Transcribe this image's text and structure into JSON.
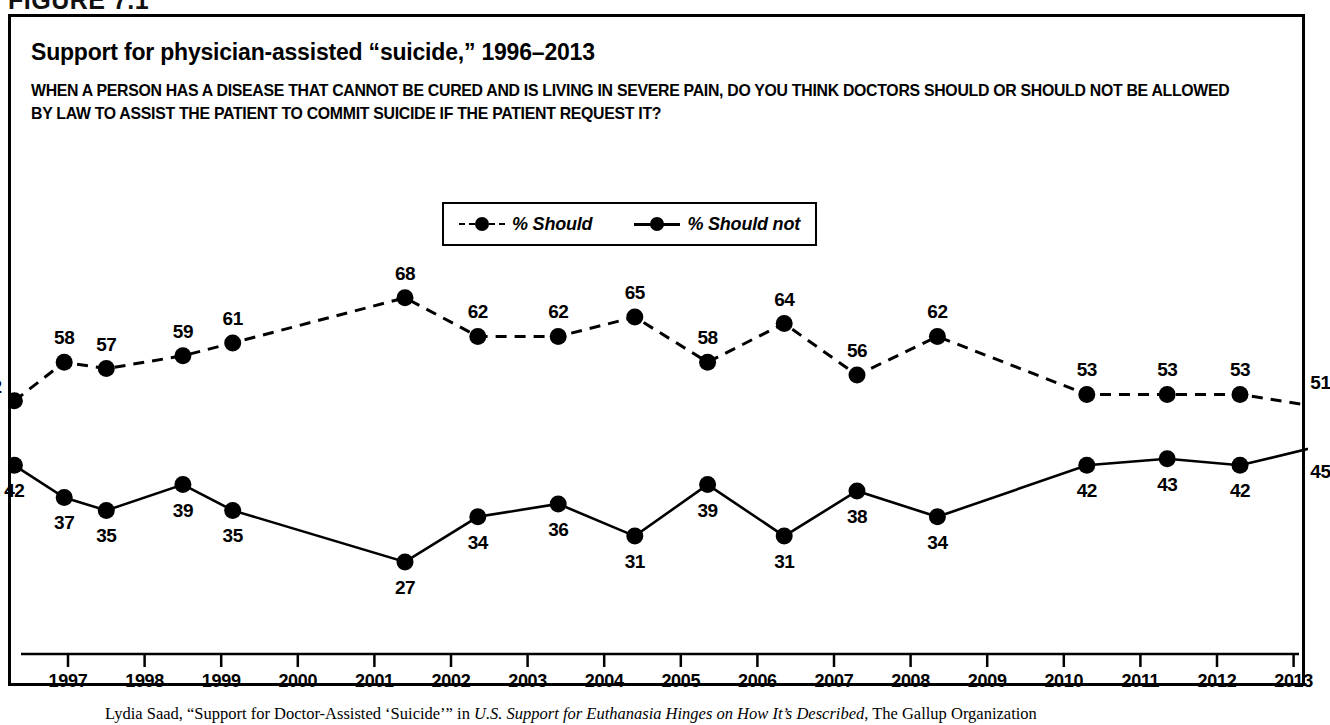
{
  "figure": {
    "label": "FIGURE 7.1"
  },
  "title": "Support for physician-assisted “suicide,” 1996–2013",
  "subtitle": "WHEN A PERSON HAS A DISEASE THAT CANNOT BE CURED AND IS LIVING IN SEVERE PAIN, DO YOU THINK DOCTORS SHOULD OR SHOULD NOT BE ALLOWED BY LAW TO ASSIST THE PATIENT TO COMMIT SUICIDE IF THE PATIENT REQUEST IT?",
  "source": {
    "prefix": "Lydia Saad, “Support for Doctor-Assisted ‘Suicide’” in ",
    "italic": "U.S. Support for Euthanasia Hinges on How It’s Described",
    "suffix": ", The Gallup Organization"
  },
  "legend": {
    "position": "top-center",
    "items": [
      {
        "label": "% Should",
        "style": "dashed"
      },
      {
        "label": "% Should not",
        "style": "solid"
      }
    ]
  },
  "chart_data": {
    "type": "line",
    "title": "Support for physician-assisted “suicide,” 1996–2013",
    "xlabel": "",
    "ylabel": "",
    "ylim": [
      20,
      72
    ],
    "xlim": [
      1996.3,
      2013.7
    ],
    "grid": false,
    "legend_position": "top-center",
    "x": [
      1996.3,
      1996.95,
      1997.5,
      1998.5,
      1999.15,
      2001.4,
      2002.35,
      2003.4,
      2004.4,
      2005.35,
      2006.35,
      2007.3,
      2008.35,
      2010.3,
      2011.35,
      2012.3,
      2013.35
    ],
    "xtick_labels": [
      "1997",
      "1998",
      "1999",
      "2000",
      "2001",
      "2002",
      "2003",
      "2004",
      "2005",
      "2006",
      "2007",
      "2008",
      "2009",
      "2010",
      "2011",
      "2012",
      "2013"
    ],
    "xtick_values": [
      1997,
      1998,
      1999,
      2000,
      2001,
      2002,
      2003,
      2004,
      2005,
      2006,
      2007,
      2008,
      2009,
      2010,
      2011,
      2012,
      2013
    ],
    "series": [
      {
        "name": "% Should",
        "style": "dashed",
        "values": [
          52,
          58,
          57,
          59,
          61,
          68,
          62,
          62,
          65,
          58,
          64,
          56,
          62,
          53,
          53,
          53,
          51
        ],
        "label_offsets": [
          "below-left",
          "above",
          "above",
          "above",
          "above",
          "above",
          "above",
          "above",
          "above",
          "above",
          "above",
          "above",
          "above",
          "above",
          "above",
          "above",
          "above"
        ]
      },
      {
        "name": "% Should not",
        "style": "solid",
        "values": [
          42,
          37,
          35,
          39,
          35,
          27,
          34,
          36,
          31,
          39,
          31,
          38,
          34,
          42,
          43,
          42,
          45
        ],
        "label_offsets": [
          "below",
          "below",
          "below",
          "below",
          "below",
          "below",
          "below",
          "below",
          "below",
          "below",
          "below",
          "below",
          "below",
          "below",
          "below",
          "below",
          "below"
        ]
      }
    ]
  },
  "colors": {
    "ink": "#000000",
    "background": "#ffffff"
  }
}
